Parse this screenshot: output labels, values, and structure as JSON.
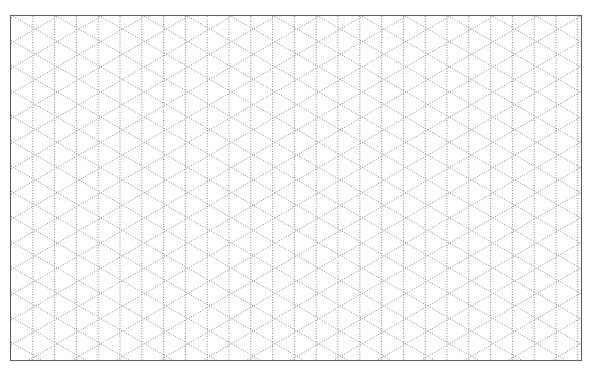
{
  "page": {
    "title": "Isometric dot grid paper"
  },
  "grid": {
    "type": "isometric",
    "line_style": "dotted",
    "column_spacing_px": 21.8,
    "row_period_px": 25.2,
    "diagonal_angle_deg": 30,
    "columns": 26,
    "colors": {
      "line": "#8a8a8a",
      "border": "#5a5a5a",
      "background": "#ffffff"
    }
  }
}
